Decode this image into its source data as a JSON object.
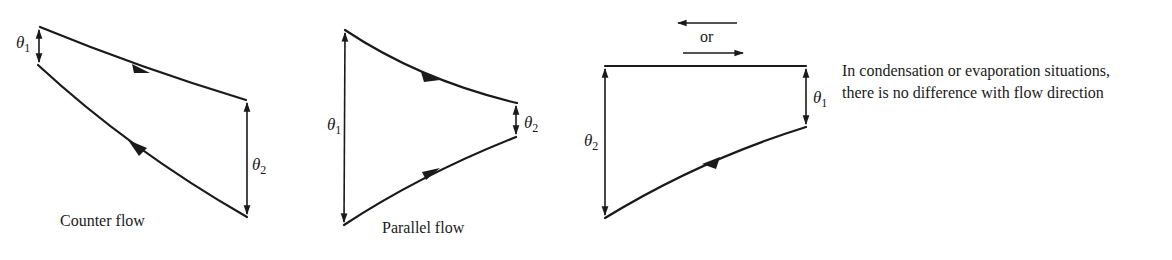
{
  "diagrams": [
    {
      "id": "counter-flow",
      "caption": "Counter flow",
      "theta_inlet": {
        "symbol": "θ",
        "subscript": "1"
      },
      "theta_outlet": {
        "symbol": "θ",
        "subscript": "2"
      }
    },
    {
      "id": "parallel-flow",
      "caption": "Parallel flow",
      "theta_inlet": {
        "symbol": "θ",
        "subscript": "1"
      },
      "theta_outlet": {
        "symbol": "θ",
        "subscript": "2"
      }
    },
    {
      "id": "phase-change",
      "caption": "",
      "direction_connector": "or",
      "theta_inlet": {
        "symbol": "θ",
        "subscript": "1"
      },
      "theta_outlet": {
        "symbol": "θ",
        "subscript": "2"
      }
    }
  ],
  "note": {
    "line1": "In condensation or evaporation situations,",
    "line2": "there is no difference with flow direction"
  },
  "colors": {
    "ink": "#1a1a1a",
    "background": "#ffffff"
  }
}
